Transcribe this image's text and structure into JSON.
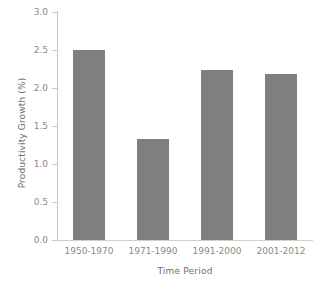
{
  "chart_data": {
    "type": "bar",
    "title": "",
    "categories": [
      "1950-1970",
      "1971-1990",
      "1991-2000",
      "2001-2012"
    ],
    "values": [
      2.5,
      1.33,
      2.24,
      2.18
    ],
    "xlabel": "Time Period",
    "ylabel": "Productivity Growth (%)",
    "ylim": [
      0.0,
      3.0
    ],
    "ytick_labels": [
      "0.0",
      "0.5",
      "1.0",
      "1.5",
      "2.0",
      "2.5",
      "3.0"
    ],
    "ytick_values": [
      0.0,
      0.5,
      1.0,
      1.5,
      2.0,
      2.5,
      3.0
    ],
    "grid": false,
    "legend": null,
    "bar_color": "#7f7f7f",
    "axis_color": "#c9c9c9",
    "text_color": "#8a8a8a"
  }
}
